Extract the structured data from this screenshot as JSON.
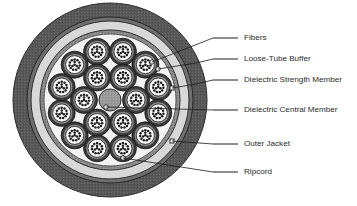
{
  "figure": {
    "background_color": "#ffffff"
  },
  "cable": {
    "center_x": 110,
    "center_y": 100,
    "layers": [
      {
        "name": "outer-jacket",
        "label": "Outer Jacket",
        "radius": 97,
        "color": "#585858",
        "stroke": "#2d2d2d"
      },
      {
        "name": "jacket-inner-edge",
        "label": "Jacket Inner Edge",
        "radius": 83,
        "color": "#6f6f6f",
        "stroke": "#262626"
      },
      {
        "name": "dielectric-strength-member",
        "label": "Dielectric Strength Member",
        "radius": 79,
        "color": "#d8d8d8",
        "stroke": "#2d2d2d"
      },
      {
        "name": "strength-member-inner-band",
        "label": "Strength Member Inner Band",
        "radius": 70,
        "color": "#8a8a8a",
        "stroke": "#2d2d2d"
      },
      {
        "name": "core-cavity",
        "label": "Core Cavity",
        "radius": 66,
        "color": "#f2f2f2",
        "stroke": "#3a3a3a"
      }
    ],
    "central_member": {
      "label": "Dielectric Central Member",
      "radius": 11,
      "color": "#999999",
      "stroke": "#2a2a2a"
    },
    "tube": {
      "label": "Loose-Tube Buffer",
      "outer_radius": 13.5,
      "outer_color": "#3a3a3a",
      "mid_radius": 11.2,
      "mid_color": "#8d8d8d",
      "inner_radius": 9.0,
      "inner_color": "#fbfbfb",
      "inner_stroke": "#1f1f1f"
    },
    "fiber": {
      "label": "Fibers",
      "radius": 1.25,
      "color": "#1c1c1c",
      "count_per_tube": 12
    },
    "rings": [
      {
        "name": "outer-tube-ring",
        "count": 12,
        "orbit_radius": 50,
        "start_angle": -105
      },
      {
        "name": "inner-tube-ring",
        "count": 6,
        "orbit_radius": 26,
        "start_angle": -60
      }
    ],
    "ripcord": {
      "label": "Ripcord",
      "x": 123,
      "y": 158,
      "radius": 2.4,
      "color": "#ffffff",
      "stroke": "#1c1c1c"
    },
    "anchors": [
      {
        "name": "fibers-anchor",
        "x": 152,
        "y": 62,
        "shape": "dot"
      },
      {
        "name": "loose-tube-anchor",
        "x": 158,
        "y": 69,
        "shape": "dot"
      },
      {
        "name": "strength-member-anchor",
        "x": 172,
        "y": 88,
        "shape": "square"
      },
      {
        "name": "central-member-anchor",
        "x": 106,
        "y": 107,
        "shape": "dot"
      },
      {
        "name": "outer-jacket-anchor",
        "x": 172,
        "y": 141,
        "shape": "square"
      },
      {
        "name": "ripcord-anchor",
        "x": 123,
        "y": 158,
        "shape": "dot"
      }
    ]
  },
  "callouts": [
    {
      "name": "fibers",
      "label": "Fibers",
      "text_x": 244,
      "text_y": 38,
      "dash_x1": 213,
      "dash_x2": 238,
      "dash_y": 38,
      "leader": "M 213 38 L 152 62"
    },
    {
      "name": "loose-tube-buffer",
      "label": "Loose-Tube Buffer",
      "text_x": 244,
      "text_y": 59,
      "dash_x1": 213,
      "dash_x2": 238,
      "dash_y": 59,
      "leader": "M 213 59 L 196 63 L 158 69"
    },
    {
      "name": "dielectric-strength-member",
      "label": "Dielectric Strength Member",
      "text_x": 244,
      "text_y": 80,
      "dash_x1": 213,
      "dash_x2": 238,
      "dash_y": 80,
      "leader": "M 213 80 L 196 84 L 172 88"
    },
    {
      "name": "dielectric-central-member",
      "label": "Dielectric Central Member",
      "text_x": 244,
      "text_y": 110,
      "dash_x1": 213,
      "dash_x2": 238,
      "dash_y": 110,
      "leader": "M 213 110 L 106 107"
    },
    {
      "name": "outer-jacket",
      "label": "Outer Jacket",
      "text_x": 244,
      "text_y": 144,
      "dash_x1": 213,
      "dash_x2": 238,
      "dash_y": 144,
      "leader": "M 213 144 L 172 141"
    },
    {
      "name": "ripcord",
      "label": "Ripcord",
      "text_x": 244,
      "text_y": 172,
      "dash_x1": 213,
      "dash_x2": 238,
      "dash_y": 172,
      "leader": "M 213 172 L 123 158"
    }
  ]
}
